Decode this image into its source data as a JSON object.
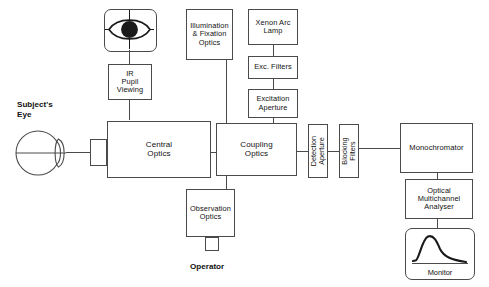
{
  "diagram": {
    "labels": {
      "subject_eye": "Subject's\nEye",
      "operator": "Operator"
    },
    "nodes": {
      "eye_icon": "pupil-eye-icon",
      "ir_pupil_viewing": "IR\nPupil\nViewing",
      "illumination_fixation_optics": "Illumination\n& Fixation\nOptics",
      "xenon_arc_lamp": "Xenon Arc\nLamp",
      "exc_filters": "Exc. Filters",
      "excitation_aperture": "Excitation\nAperture",
      "central_optics": "Central\nOptics",
      "coupling_optics": "Coupling\nOptics",
      "detection_aperture": "Detection\nAperture",
      "blocking_filters": "Blocking\nFilters",
      "monochromator": "Monochromator",
      "optical_multichannel_analyser": "Optical\nMultichannel\nAnalyser",
      "observation_optics": "Observation\nOptics",
      "monitor": "Monitor"
    },
    "colors": {
      "stroke": "#4a4a4a",
      "text": "#111111",
      "background": "#ffffff",
      "pupil_fill": "#1a1a1a"
    }
  }
}
